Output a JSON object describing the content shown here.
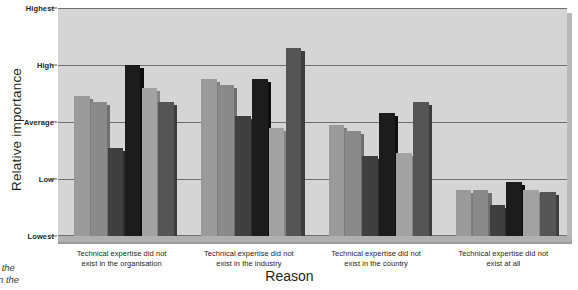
{
  "chart_data": {
    "type": "bar",
    "title": "",
    "xlabel": "Reason",
    "ylabel": "Relative importance",
    "orientation": "vertical",
    "grouping": "grouped",
    "grid": true,
    "legend": "none",
    "ylim": [
      0,
      4
    ],
    "ytick_values": [
      0,
      1,
      2,
      3,
      4
    ],
    "ytick_labels": [
      "Lowest",
      "Low",
      "Average",
      "High",
      "Highest"
    ],
    "categories": [
      "Technical expertise did not exist in the organisation",
      "Technical expertise did not exist in the industry",
      "Technical expertise did not exist in the country",
      "Technical expertise did not exist at all"
    ],
    "category_lines": [
      [
        "Technical expertise did not",
        "exist in the organisation"
      ],
      [
        "Technical expertise did not",
        "exist in the industry"
      ],
      [
        "Technical expertise did not",
        "exist in the country"
      ],
      [
        "Technical expertise did not",
        "exist at all"
      ]
    ],
    "series": [
      {
        "name": "Series 1",
        "color": "#9a9a9a",
        "side_color": "#7d7d7d",
        "values": [
          2.45,
          2.75,
          1.95,
          0.8
        ]
      },
      {
        "name": "Series 2",
        "color": "#8a8a8a",
        "side_color": "#6f6f6f",
        "values": [
          2.35,
          2.65,
          1.85,
          0.8
        ]
      },
      {
        "name": "Series 3",
        "color": "#3f3f3f",
        "side_color": "#2c2c2c",
        "values": [
          1.55,
          2.1,
          1.4,
          0.55
        ]
      },
      {
        "name": "Series 4",
        "color": "#1c1c1c",
        "side_color": "#0f0f0f",
        "values": [
          3.0,
          2.75,
          2.15,
          0.95
        ]
      },
      {
        "name": "Series 5",
        "color": "#a2a2a2",
        "side_color": "#858585",
        "values": [
          2.6,
          1.9,
          1.45,
          0.8
        ]
      },
      {
        "name": "Series 6",
        "color": "#555555",
        "side_color": "#3d3d3d",
        "values": [
          2.35,
          3.3,
          2.35,
          0.78
        ]
      }
    ],
    "colors": {
      "panel_background": "#d5d5d5",
      "panel_shadow": "#b9b9b9",
      "gridline": "#6e6f71",
      "floor": "#b0b0b0",
      "text": "#231f20"
    }
  },
  "caption": {
    "lines": [
      "Why the",
      "ted in the"
    ]
  }
}
